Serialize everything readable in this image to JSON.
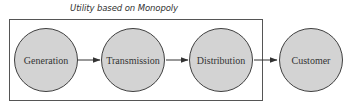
{
  "diagram": {
    "title": "Utility based on Monopoly",
    "nodes": [
      {
        "id": "generation",
        "label": "Generation"
      },
      {
        "id": "transmission",
        "label": "Transmission"
      },
      {
        "id": "distribution",
        "label": "Distribution"
      },
      {
        "id": "customer",
        "label": "Customer"
      }
    ],
    "edges": [
      {
        "from": "generation",
        "to": "transmission"
      },
      {
        "from": "transmission",
        "to": "distribution"
      },
      {
        "from": "distribution",
        "to": "customer"
      }
    ],
    "groups": [
      {
        "label": "Utility based on Monopoly",
        "contains": [
          "generation",
          "transmission",
          "distribution"
        ]
      }
    ],
    "colors": {
      "node_fill": "#d3d3d3",
      "node_stroke": "#3f3f3f",
      "edge": "#333333",
      "boundary": "#555555"
    }
  }
}
